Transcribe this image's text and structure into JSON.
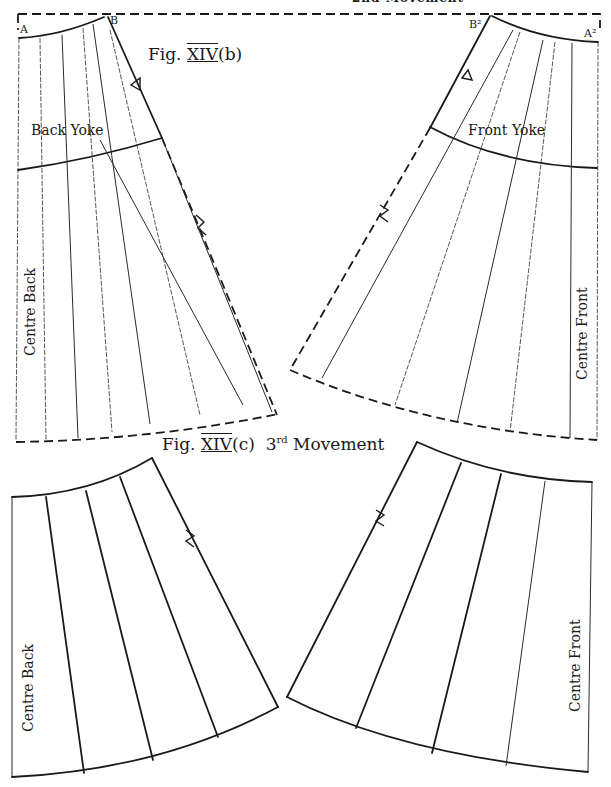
{
  "header_cutoff_text": "2nd Movement",
  "figure_b": {
    "title_prefix": "Fig.",
    "title_numeral": "XIV",
    "title_suffix": "(b)",
    "back_piece": {
      "yoke_label": "Back Yoke",
      "side_label": "Centre Back",
      "point_a": "A",
      "point_b": "B"
    },
    "front_piece": {
      "yoke_label": "Front Yoke",
      "side_label": "Centre Front",
      "point_a": "A²",
      "point_b": "B²"
    }
  },
  "figure_c": {
    "title_prefix": "Fig.",
    "title_numeral": "XIV",
    "title_suffix": "(c)",
    "movement_ordinal": "3",
    "movement_sup": "rd",
    "movement_label": "Movement",
    "back_piece": {
      "side_label": "Centre Back"
    },
    "front_piece": {
      "side_label": "Centre Front"
    }
  },
  "colors": {
    "ink": "#1a1a1a",
    "paper": "#ffffff"
  }
}
